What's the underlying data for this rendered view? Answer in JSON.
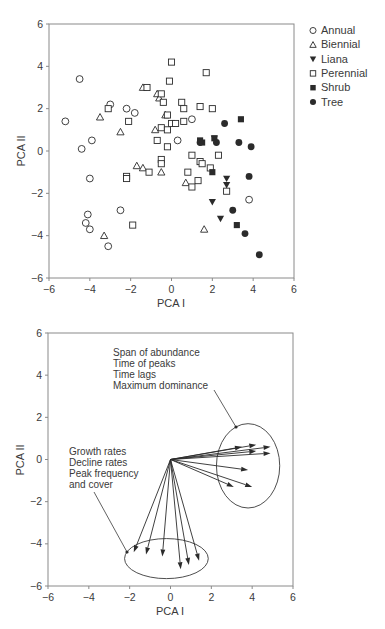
{
  "chart_data": [
    {
      "type": "scatter",
      "title": "",
      "xlabel": "PCA I",
      "ylabel": "PCA II",
      "xlim": [
        -6,
        6
      ],
      "ylim": [
        -6,
        6
      ],
      "xticks": [
        -6,
        -4,
        -2,
        0,
        2,
        4,
        6
      ],
      "yticks": [
        -6,
        -4,
        -2,
        0,
        2,
        4,
        6
      ],
      "grid": false,
      "legend_position": "right",
      "series": [
        {
          "name": "Annual",
          "marker": "open-circle",
          "points": [
            [
              -5.2,
              1.4
            ],
            [
              -4.5,
              3.4
            ],
            [
              -4.4,
              0.1
            ],
            [
              -3.9,
              0.5
            ],
            [
              -4.0,
              -1.3
            ],
            [
              -4.1,
              -3.0
            ],
            [
              -4.2,
              -3.4
            ],
            [
              -4.0,
              -3.7
            ],
            [
              -3.1,
              -4.5
            ],
            [
              -3.0,
              2.2
            ],
            [
              -2.2,
              2.0
            ],
            [
              -1.8,
              1.8
            ],
            [
              -2.5,
              -2.8
            ],
            [
              1.0,
              1.5
            ],
            [
              0.3,
              0.5
            ],
            [
              3.8,
              -2.3
            ]
          ]
        },
        {
          "name": "Biennial",
          "marker": "open-triangle",
          "points": [
            [
              -3.5,
              1.6
            ],
            [
              -2.5,
              0.9
            ],
            [
              -3.3,
              -4.0
            ],
            [
              -1.7,
              -0.7
            ],
            [
              -1.4,
              -0.8
            ],
            [
              -1.4,
              3.0
            ],
            [
              -0.7,
              2.7
            ],
            [
              -0.6,
              2.5
            ],
            [
              -0.3,
              1.7
            ],
            [
              -0.8,
              1.0
            ],
            [
              -0.5,
              -1.0
            ],
            [
              0.7,
              -1.5
            ],
            [
              1.6,
              -3.7
            ]
          ]
        },
        {
          "name": "Liana",
          "marker": "filled-down-triangle",
          "points": [
            [
              2.0,
              -2.4
            ],
            [
              2.4,
              -3.2
            ],
            [
              2.7,
              -1.3
            ],
            [
              2.7,
              -1.6
            ],
            [
              2.1,
              0.6
            ]
          ]
        },
        {
          "name": "Perennial",
          "marker": "open-square",
          "points": [
            [
              0.0,
              4.2
            ],
            [
              1.7,
              3.7
            ],
            [
              -1.2,
              3.0
            ],
            [
              -0.5,
              2.7
            ],
            [
              -0.1,
              3.3
            ],
            [
              -3.1,
              2.0
            ],
            [
              -0.4,
              2.3
            ],
            [
              0.5,
              2.3
            ],
            [
              0.6,
              2.0
            ],
            [
              1.4,
              2.1
            ],
            [
              2.0,
              2.0
            ],
            [
              -2.1,
              1.4
            ],
            [
              -0.2,
              1.7
            ],
            [
              0.6,
              1.4
            ],
            [
              0.0,
              1.3
            ],
            [
              0.2,
              1.3
            ],
            [
              -0.5,
              1.1
            ],
            [
              -0.2,
              1.0
            ],
            [
              -0.7,
              0.5
            ],
            [
              -0.2,
              0.2
            ],
            [
              1.0,
              -0.2
            ],
            [
              1.4,
              -0.5
            ],
            [
              1.5,
              -0.6
            ],
            [
              2.3,
              -0.2
            ],
            [
              -2.2,
              -1.2
            ],
            [
              -2.2,
              -1.3
            ],
            [
              -1.1,
              -1.0
            ],
            [
              -0.5,
              -0.4
            ],
            [
              -0.5,
              -0.6
            ],
            [
              0.8,
              -1.0
            ],
            [
              1.3,
              -1.4
            ],
            [
              1.0,
              -1.7
            ],
            [
              1.9,
              -0.8
            ],
            [
              2.7,
              -1.9
            ],
            [
              -1.9,
              -3.5
            ]
          ]
        },
        {
          "name": "Shrub",
          "marker": "filled-square",
          "points": [
            [
              1.5,
              0.4
            ],
            [
              2.0,
              -1.0
            ],
            [
              3.2,
              -3.5
            ],
            [
              3.4,
              1.5
            ],
            [
              1.4,
              0.5
            ],
            [
              2.1,
              0.6
            ]
          ]
        },
        {
          "name": "Tree",
          "marker": "filled-circle",
          "points": [
            [
              2.6,
              1.3
            ],
            [
              3.3,
              0.4
            ],
            [
              3.9,
              0.2
            ],
            [
              3.8,
              -1.2
            ],
            [
              3.0,
              -2.8
            ],
            [
              3.6,
              -3.9
            ],
            [
              4.3,
              -4.9
            ],
            [
              2.2,
              0.4
            ],
            [
              1.4,
              0.4
            ]
          ]
        }
      ]
    },
    {
      "type": "biplot-vectors",
      "title": "",
      "xlabel": "PCA I",
      "ylabel": "PCA II",
      "xlim": [
        -6,
        6
      ],
      "ylim": [
        -6,
        6
      ],
      "xticks": [
        -6,
        -4,
        -2,
        0,
        2,
        4,
        6
      ],
      "yticks": [
        -6,
        -4,
        -2,
        0,
        2,
        4,
        6
      ],
      "grid": false,
      "origin": [
        0,
        0
      ],
      "groups": [
        {
          "name": "Span of abundance / Time of peaks / Time lags / Maximum dominance",
          "label_lines": [
            "Span of abundance",
            "Time of peaks",
            "Time lags",
            "Maximum dominance"
          ],
          "vectors": [
            [
              3.5,
              0.6
            ],
            [
              4.2,
              0.7
            ],
            [
              4.9,
              0.6
            ],
            [
              4.9,
              0.3
            ],
            [
              4.2,
              0.4
            ],
            [
              3.8,
              -0.5
            ],
            [
              4.0,
              -1.3
            ],
            [
              3.1,
              -1.3
            ]
          ],
          "ellipse": {
            "center": [
              3.8,
              -0.3
            ],
            "rx": 1.55,
            "ry": 2.0
          }
        },
        {
          "name": "Growth rates / Decline rates / Peak frequency and cover",
          "label_lines": [
            "Growth rates",
            "Decline rates",
            "Peak frequency",
            "and cover"
          ],
          "vectors": [
            [
              -1.8,
              -4.4
            ],
            [
              -1.2,
              -4.5
            ],
            [
              -0.4,
              -4.6
            ],
            [
              0.5,
              -5.2
            ],
            [
              0.9,
              -5.0
            ],
            [
              1.4,
              -4.8
            ]
          ],
          "ellipse": {
            "center": [
              -0.2,
              -4.7
            ],
            "rx": 2.05,
            "ry": 0.95
          }
        }
      ]
    }
  ],
  "chart1": {
    "xlabel": "PCA I",
    "ylabel": "PCA II",
    "xticks": [
      "−6",
      "−4",
      "−2",
      "0",
      "2",
      "4",
      "6"
    ],
    "yticks": [
      "6",
      "4",
      "2",
      "0",
      "−2",
      "−4",
      "−6"
    ],
    "legend": [
      {
        "label": "Annual",
        "icon": "open-circle-icon"
      },
      {
        "label": "Biennial",
        "icon": "open-triangle-icon"
      },
      {
        "label": "Liana",
        "icon": "filled-down-triangle-icon"
      },
      {
        "label": "Perennial",
        "icon": "open-square-icon"
      },
      {
        "label": "Shrub",
        "icon": "filled-square-icon"
      },
      {
        "label": "Tree",
        "icon": "filled-circle-icon"
      }
    ]
  },
  "chart2": {
    "xlabel": "PCA I",
    "ylabel": "PCA II",
    "xticks": [
      "−6",
      "−4",
      "−2",
      "0",
      "2",
      "4",
      "6"
    ],
    "yticks": [
      "6",
      "4",
      "2",
      "0",
      "−2",
      "−4",
      "−6"
    ],
    "annotation_upper": [
      "Span of abundance",
      "Time of peaks",
      "Time lags",
      "Maximum dominance"
    ],
    "annotation_lower": [
      "Growth rates",
      "Decline rates",
      "Peak frequency",
      "and cover"
    ]
  },
  "colors": {
    "frame": "#8a8a8a",
    "marker": "#2b2b2b",
    "text": "#3a3a3a",
    "background": "#ffffff"
  }
}
